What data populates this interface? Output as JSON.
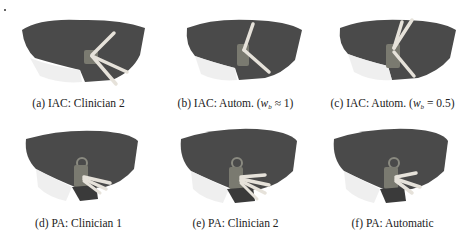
{
  "figure": {
    "subfigures": [
      {
        "id": "a",
        "label": "(a)",
        "caption": "IAC: Clinician 2",
        "scenario": "IAC",
        "planner": "Clinician 2",
        "needle_count": 3
      },
      {
        "id": "b",
        "label": "(b)",
        "caption_prefix": "IAC: Autom. (",
        "caption_var": "w",
        "caption_sub": "b",
        "caption_suffix": " ≈ 1)",
        "scenario": "IAC",
        "planner": "Automatic",
        "weight": "w_b ≈ 1",
        "needle_count": 2
      },
      {
        "id": "c",
        "label": "(c)",
        "caption_prefix": "IAC: Autom. (",
        "caption_var": "w",
        "caption_sub": "b",
        "caption_suffix": " = 0.5)",
        "scenario": "IAC",
        "planner": "Automatic",
        "weight": "w_b = 0.5",
        "needle_count": 3
      },
      {
        "id": "d",
        "label": "(d)",
        "caption": "PA: Clinician 1",
        "scenario": "PA",
        "planner": "Clinician 1",
        "needle_count": 3
      },
      {
        "id": "e",
        "label": "(e)",
        "caption": "PA: Clinician 2",
        "scenario": "PA",
        "planner": "Clinician 2",
        "needle_count": 4
      },
      {
        "id": "f",
        "label": "(f)",
        "caption": "PA: Automatic",
        "scenario": "PA",
        "planner": "Automatic",
        "needle_count": 3
      }
    ],
    "colors": {
      "organ": "#4a4a4a",
      "organ_dark": "#333333",
      "needle": "#e6e2da",
      "vessel": "#7a7a70",
      "background": "#ffffff",
      "caption": "#222222"
    }
  }
}
